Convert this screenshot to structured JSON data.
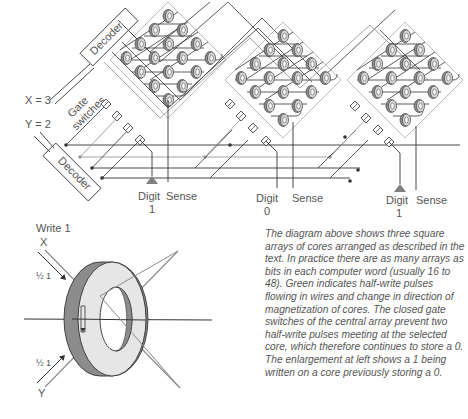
{
  "diagram": {
    "labels": {
      "x_input": "X = 3",
      "y_input": "Y = 2",
      "decoder_top": "Decoder",
      "decoder_bottom": "Decoder",
      "gate_switches": "Gate switches"
    },
    "arrays": [
      {
        "name": "left",
        "digit_label": "Digit",
        "digit_value": "1",
        "sense_label": "Sense"
      },
      {
        "name": "center",
        "digit_label": "Digit",
        "digit_value": "0",
        "sense_label": "Sense"
      },
      {
        "name": "right",
        "digit_label": "Digit",
        "digit_value": "1",
        "sense_label": "Sense"
      }
    ],
    "enlargement": {
      "title": "Write 1",
      "x_label": "X",
      "y_label": "Y",
      "x_current": "½ 1",
      "y_current": "½ 1"
    },
    "colors": {
      "line": "#333333",
      "halfwrite": "#9a9a9a",
      "core_dark": "#8c8c8c",
      "core_light": "#e6e6e6",
      "triangle": "#808080"
    }
  },
  "caption": "The diagram above shows three square arrays of cores arranged as described in the text. In practice there are as many arrays as bits in each computer word (usually 16 to 48). Green indicates half-write pulses flowing in wires and change in direction of magnetization of cores. The closed gate switches of the central array prevent two half-write pulses meeting at the selected core, which therefore continues to store a 0. The enlargement at left shows a 1 being written on a core previously storing a 0."
}
